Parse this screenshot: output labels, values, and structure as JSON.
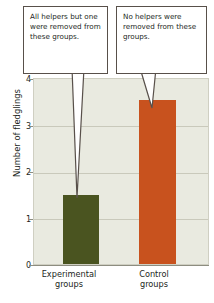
{
  "chart_data": {
    "type": "bar",
    "title": "",
    "xlabel": "",
    "ylabel": "Number of fledglings",
    "categories": [
      "Experimental groups",
      "Control groups"
    ],
    "values": [
      1.5,
      3.55
    ],
    "ylim": [
      0,
      4
    ],
    "yticks": [
      "0",
      "1",
      "2",
      "3",
      "4"
    ],
    "ytick_values": [
      0,
      1,
      2,
      3,
      4
    ],
    "grid": true,
    "legend": "none",
    "bar_colors": [
      "#4a5420",
      "#c8521e"
    ],
    "plot_background": "#e9eae0",
    "gridline_color": "#c9c9bb",
    "annotations": [
      {
        "name": "experimental-callout",
        "text": "All helpers but one were removed from these groups.",
        "points_to": "Experimental groups"
      },
      {
        "name": "control-callout",
        "text": "No helpers were removed from these groups.",
        "points_to": "Control groups"
      }
    ]
  },
  "callouts": {
    "left": "All helpers but one were removed from these groups.",
    "right": "No helpers were removed from these groups."
  },
  "axis": {
    "y_title": "Number of fledglings",
    "y_ticks": [
      "4",
      "3",
      "2",
      "1",
      "0"
    ],
    "x_labels": [
      "Experimental groups",
      "Control groups"
    ]
  }
}
